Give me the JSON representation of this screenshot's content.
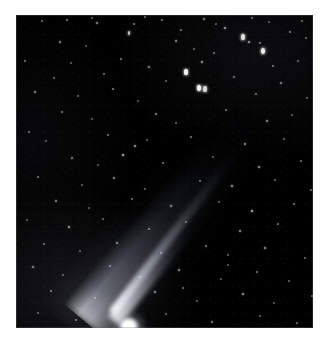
{
  "page": {
    "background_color": "#ffffff",
    "width": 333,
    "height": 350
  },
  "photo": {
    "label": "comet-photograph",
    "alt_text": "Astronomical photograph of a comet with a bright nucleus at lower left and a long dust tail extending toward the upper right across a dense star field",
    "subject": "comet",
    "background_color": "#000000",
    "frame": {
      "x": 16,
      "y": 15,
      "width": 297,
      "height": 313
    },
    "star_color": "#ffffff",
    "comet_color": "#ffffff",
    "tail_color": "#b4bac6"
  },
  "comet": {
    "nucleus": {
      "x": 112,
      "y": 311,
      "brightness": 1.0
    },
    "coma": {
      "cx": 113,
      "cy": 312,
      "rx": 17,
      "ry": 16
    },
    "tail_angle_deg": -51,
    "tail_length": 250,
    "tail_direction": "upper-right"
  },
  "chart_data": {
    "type": "scatter",
    "title": "",
    "xlabel": "",
    "ylabel": "",
    "xlim": [
      0,
      297
    ],
    "ylim": [
      0,
      313
    ],
    "grid": false,
    "legend": null,
    "series": [
      {
        "name": "stars",
        "note": "x, y are pixel coordinates inside the photographic plate; r = radius in px; b = relative brightness 0-1",
        "points": [
          {
            "x": 26,
            "y": 6,
            "r": 1.0,
            "b": 0.45
          },
          {
            "x": 51,
            "y": 5,
            "r": 1.1,
            "b": 0.5
          },
          {
            "x": 76,
            "y": 3,
            "r": 1.0,
            "b": 0.4
          },
          {
            "x": 81,
            "y": 8,
            "r": 1.2,
            "b": 0.55
          },
          {
            "x": 118,
            "y": 9,
            "r": 1.1,
            "b": 0.48
          },
          {
            "x": 129,
            "y": 2,
            "r": 1.0,
            "b": 0.42
          },
          {
            "x": 146,
            "y": 5,
            "r": 1.1,
            "b": 0.45
          },
          {
            "x": 188,
            "y": 4,
            "r": 1.2,
            "b": 0.55
          },
          {
            "x": 200,
            "y": 9,
            "r": 1.0,
            "b": 0.4
          },
          {
            "x": 236,
            "y": 3,
            "r": 1.1,
            "b": 0.45
          },
          {
            "x": 253,
            "y": 7,
            "r": 1.0,
            "b": 0.38
          },
          {
            "x": 286,
            "y": 6,
            "r": 1.0,
            "b": 0.42
          },
          {
            "x": 113,
            "y": 18,
            "r": 1.4,
            "b": 0.75
          },
          {
            "x": 165,
            "y": 15,
            "r": 1.1,
            "b": 0.45
          },
          {
            "x": 209,
            "y": 13,
            "r": 1.3,
            "b": 0.62
          },
          {
            "x": 274,
            "y": 17,
            "r": 1.1,
            "b": 0.48
          },
          {
            "x": 290,
            "y": 23,
            "r": 1.0,
            "b": 0.4
          },
          {
            "x": 44,
            "y": 27,
            "r": 1.2,
            "b": 0.52
          },
          {
            "x": 70,
            "y": 31,
            "r": 1.0,
            "b": 0.38
          },
          {
            "x": 160,
            "y": 26,
            "r": 1.2,
            "b": 0.55
          },
          {
            "x": 227,
            "y": 22,
            "r": 1.6,
            "b": 0.88
          },
          {
            "x": 233,
            "y": 27,
            "r": 1.3,
            "b": 0.62
          },
          {
            "x": 244,
            "y": 28,
            "r": 1.1,
            "b": 0.45
          },
          {
            "x": 178,
            "y": 34,
            "r": 1.0,
            "b": 0.4
          },
          {
            "x": 198,
            "y": 38,
            "r": 1.1,
            "b": 0.44
          },
          {
            "x": 247,
            "y": 36,
            "r": 1.7,
            "b": 0.92
          },
          {
            "x": 298,
            "y": 31,
            "r": 1.0,
            "b": 0.4
          },
          {
            "x": 9,
            "y": 46,
            "r": 1.1,
            "b": 0.46
          },
          {
            "x": 55,
            "y": 48,
            "r": 1.0,
            "b": 0.38
          },
          {
            "x": 105,
            "y": 44,
            "r": 1.1,
            "b": 0.48
          },
          {
            "x": 133,
            "y": 52,
            "r": 1.2,
            "b": 0.55
          },
          {
            "x": 186,
            "y": 47,
            "r": 1.3,
            "b": 0.6
          },
          {
            "x": 257,
            "y": 51,
            "r": 1.1,
            "b": 0.46
          },
          {
            "x": 282,
            "y": 46,
            "r": 1.0,
            "b": 0.4
          },
          {
            "x": 38,
            "y": 63,
            "r": 1.0,
            "b": 0.4
          },
          {
            "x": 88,
            "y": 59,
            "r": 1.1,
            "b": 0.44
          },
          {
            "x": 150,
            "y": 66,
            "r": 1.0,
            "b": 0.38
          },
          {
            "x": 170,
            "y": 57,
            "r": 1.8,
            "b": 0.95
          },
          {
            "x": 218,
            "y": 62,
            "r": 1.1,
            "b": 0.46
          },
          {
            "x": 265,
            "y": 68,
            "r": 1.2,
            "b": 0.52
          },
          {
            "x": 303,
            "y": 60,
            "r": 1.0,
            "b": 0.38
          },
          {
            "x": 19,
            "y": 77,
            "r": 1.2,
            "b": 0.55
          },
          {
            "x": 62,
            "y": 81,
            "r": 1.0,
            "b": 0.4
          },
          {
            "x": 97,
            "y": 74,
            "r": 1.1,
            "b": 0.48
          },
          {
            "x": 122,
            "y": 86,
            "r": 1.0,
            "b": 0.38
          },
          {
            "x": 183,
            "y": 73,
            "r": 2.0,
            "b": 1.0
          },
          {
            "x": 189,
            "y": 74,
            "r": 1.6,
            "b": 0.85
          },
          {
            "x": 240,
            "y": 79,
            "r": 1.1,
            "b": 0.45
          },
          {
            "x": 291,
            "y": 83,
            "r": 1.0,
            "b": 0.4
          },
          {
            "x": 46,
            "y": 97,
            "r": 1.1,
            "b": 0.46
          },
          {
            "x": 76,
            "y": 104,
            "r": 1.0,
            "b": 0.38
          },
          {
            "x": 140,
            "y": 99,
            "r": 1.2,
            "b": 0.52
          },
          {
            "x": 160,
            "y": 108,
            "r": 1.0,
            "b": 0.4
          },
          {
            "x": 210,
            "y": 95,
            "r": 1.1,
            "b": 0.48
          },
          {
            "x": 251,
            "y": 106,
            "r": 1.2,
            "b": 0.55
          },
          {
            "x": 276,
            "y": 100,
            "r": 1.0,
            "b": 0.38
          },
          {
            "x": 13,
            "y": 117,
            "r": 1.1,
            "b": 0.45
          },
          {
            "x": 30,
            "y": 126,
            "r": 1.0,
            "b": 0.38
          },
          {
            "x": 92,
            "y": 120,
            "r": 1.1,
            "b": 0.48
          },
          {
            "x": 119,
            "y": 131,
            "r": 1.3,
            "b": 0.62
          },
          {
            "x": 131,
            "y": 125,
            "r": 1.0,
            "b": 0.4
          },
          {
            "x": 175,
            "y": 122,
            "r": 1.1,
            "b": 0.45
          },
          {
            "x": 229,
            "y": 129,
            "r": 1.2,
            "b": 0.55
          },
          {
            "x": 268,
            "y": 124,
            "r": 1.0,
            "b": 0.4
          },
          {
            "x": 299,
            "y": 133,
            "r": 1.1,
            "b": 0.46
          },
          {
            "x": 56,
            "y": 143,
            "r": 1.2,
            "b": 0.52
          },
          {
            "x": 82,
            "y": 150,
            "r": 1.0,
            "b": 0.38
          },
          {
            "x": 107,
            "y": 140,
            "r": 1.4,
            "b": 0.7
          },
          {
            "x": 147,
            "y": 148,
            "r": 1.1,
            "b": 0.46
          },
          {
            "x": 197,
            "y": 142,
            "r": 1.0,
            "b": 0.4
          },
          {
            "x": 243,
            "y": 152,
            "r": 1.3,
            "b": 0.6
          },
          {
            "x": 285,
            "y": 146,
            "r": 1.1,
            "b": 0.44
          },
          {
            "x": 22,
            "y": 162,
            "r": 1.1,
            "b": 0.48
          },
          {
            "x": 66,
            "y": 170,
            "r": 1.0,
            "b": 0.38
          },
          {
            "x": 98,
            "y": 163,
            "r": 1.2,
            "b": 0.55
          },
          {
            "x": 129,
            "y": 174,
            "r": 1.0,
            "b": 0.4
          },
          {
            "x": 184,
            "y": 166,
            "r": 1.1,
            "b": 0.46
          },
          {
            "x": 216,
            "y": 171,
            "r": 1.3,
            "b": 0.62
          },
          {
            "x": 259,
            "y": 165,
            "r": 1.0,
            "b": 0.4
          },
          {
            "x": 295,
            "y": 175,
            "r": 1.1,
            "b": 0.45
          },
          {
            "x": 40,
            "y": 186,
            "r": 1.2,
            "b": 0.52
          },
          {
            "x": 73,
            "y": 193,
            "r": 1.0,
            "b": 0.38
          },
          {
            "x": 116,
            "y": 184,
            "r": 1.1,
            "b": 0.46
          },
          {
            "x": 155,
            "y": 191,
            "r": 1.2,
            "b": 0.55
          },
          {
            "x": 203,
            "y": 187,
            "r": 1.0,
            "b": 0.4
          },
          {
            "x": 236,
            "y": 196,
            "r": 1.4,
            "b": 0.7
          },
          {
            "x": 278,
            "y": 189,
            "r": 1.1,
            "b": 0.46
          },
          {
            "x": 11,
            "y": 205,
            "r": 1.0,
            "b": 0.38
          },
          {
            "x": 53,
            "y": 212,
            "r": 1.3,
            "b": 0.6
          },
          {
            "x": 87,
            "y": 204,
            "r": 1.0,
            "b": 0.4
          },
          {
            "x": 133,
            "y": 214,
            "r": 1.1,
            "b": 0.48
          },
          {
            "x": 170,
            "y": 207,
            "r": 1.0,
            "b": 0.38
          },
          {
            "x": 224,
            "y": 216,
            "r": 1.2,
            "b": 0.55
          },
          {
            "x": 262,
            "y": 209,
            "r": 1.1,
            "b": 0.45
          },
          {
            "x": 301,
            "y": 218,
            "r": 1.5,
            "b": 0.8
          },
          {
            "x": 28,
            "y": 229,
            "r": 1.1,
            "b": 0.46
          },
          {
            "x": 64,
            "y": 236,
            "r": 1.0,
            "b": 0.38
          },
          {
            "x": 101,
            "y": 228,
            "r": 1.2,
            "b": 0.52
          },
          {
            "x": 145,
            "y": 238,
            "r": 1.0,
            "b": 0.4
          },
          {
            "x": 190,
            "y": 231,
            "r": 1.1,
            "b": 0.48
          },
          {
            "x": 212,
            "y": 240,
            "r": 1.0,
            "b": 0.38
          },
          {
            "x": 249,
            "y": 233,
            "r": 1.3,
            "b": 0.6
          },
          {
            "x": 289,
            "y": 243,
            "r": 1.0,
            "b": 0.4
          },
          {
            "x": 17,
            "y": 252,
            "r": 1.2,
            "b": 0.52
          },
          {
            "x": 47,
            "y": 260,
            "r": 1.0,
            "b": 0.38
          },
          {
            "x": 94,
            "y": 251,
            "r": 1.1,
            "b": 0.46
          },
          {
            "x": 124,
            "y": 262,
            "r": 1.0,
            "b": 0.4
          },
          {
            "x": 163,
            "y": 255,
            "r": 1.2,
            "b": 0.55
          },
          {
            "x": 205,
            "y": 264,
            "r": 1.0,
            "b": 0.38
          },
          {
            "x": 241,
            "y": 257,
            "r": 1.1,
            "b": 0.46
          },
          {
            "x": 273,
            "y": 266,
            "r": 1.0,
            "b": 0.4
          },
          {
            "x": 35,
            "y": 276,
            "r": 1.1,
            "b": 0.48
          },
          {
            "x": 79,
            "y": 283,
            "r": 1.0,
            "b": 0.38
          },
          {
            "x": 139,
            "y": 277,
            "r": 1.2,
            "b": 0.55
          },
          {
            "x": 181,
            "y": 286,
            "r": 1.0,
            "b": 0.4
          },
          {
            "x": 227,
            "y": 279,
            "r": 1.3,
            "b": 0.6
          },
          {
            "x": 258,
            "y": 288,
            "r": 1.0,
            "b": 0.38
          },
          {
            "x": 296,
            "y": 281,
            "r": 1.1,
            "b": 0.45
          },
          {
            "x": 22,
            "y": 298,
            "r": 1.0,
            "b": 0.4
          },
          {
            "x": 60,
            "y": 305,
            "r": 1.1,
            "b": 0.46
          },
          {
            "x": 150,
            "y": 299,
            "r": 1.0,
            "b": 0.38
          },
          {
            "x": 196,
            "y": 307,
            "r": 1.2,
            "b": 0.52
          },
          {
            "x": 244,
            "y": 301,
            "r": 1.0,
            "b": 0.4
          },
          {
            "x": 281,
            "y": 308,
            "r": 1.1,
            "b": 0.45
          },
          {
            "x": 104,
            "y": 293,
            "r": 1.0,
            "b": 0.38
          },
          {
            "x": 167,
            "y": 273,
            "r": 1.1,
            "b": 0.44
          },
          {
            "x": 212,
            "y": 250,
            "r": 1.0,
            "b": 0.38
          }
        ]
      }
    ]
  }
}
